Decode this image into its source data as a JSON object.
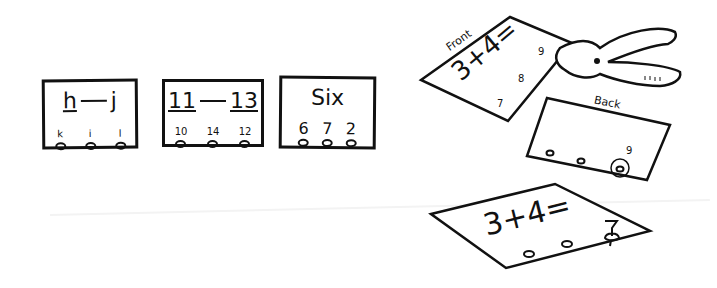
{
  "cards": [
    {
      "prompt_left": "h",
      "prompt_right": "j",
      "options": [
        "k",
        "i",
        "l"
      ]
    },
    {
      "prompt_left": "11",
      "prompt_right": "13",
      "options": [
        "10",
        "14",
        "12"
      ]
    },
    {
      "prompt": "Six",
      "options": [
        "6",
        "7",
        "2"
      ]
    }
  ],
  "front_card": {
    "label": "Front",
    "problem": "3+4=",
    "answers": [
      "9",
      "8",
      "7"
    ]
  },
  "back_card": {
    "label": "Back",
    "marked_answer": "9"
  },
  "bottom_card": {
    "problem": "3+4="
  },
  "icons": {
    "tool": "hole-punch-icon",
    "peg": "golf-tee-peg-icon"
  }
}
